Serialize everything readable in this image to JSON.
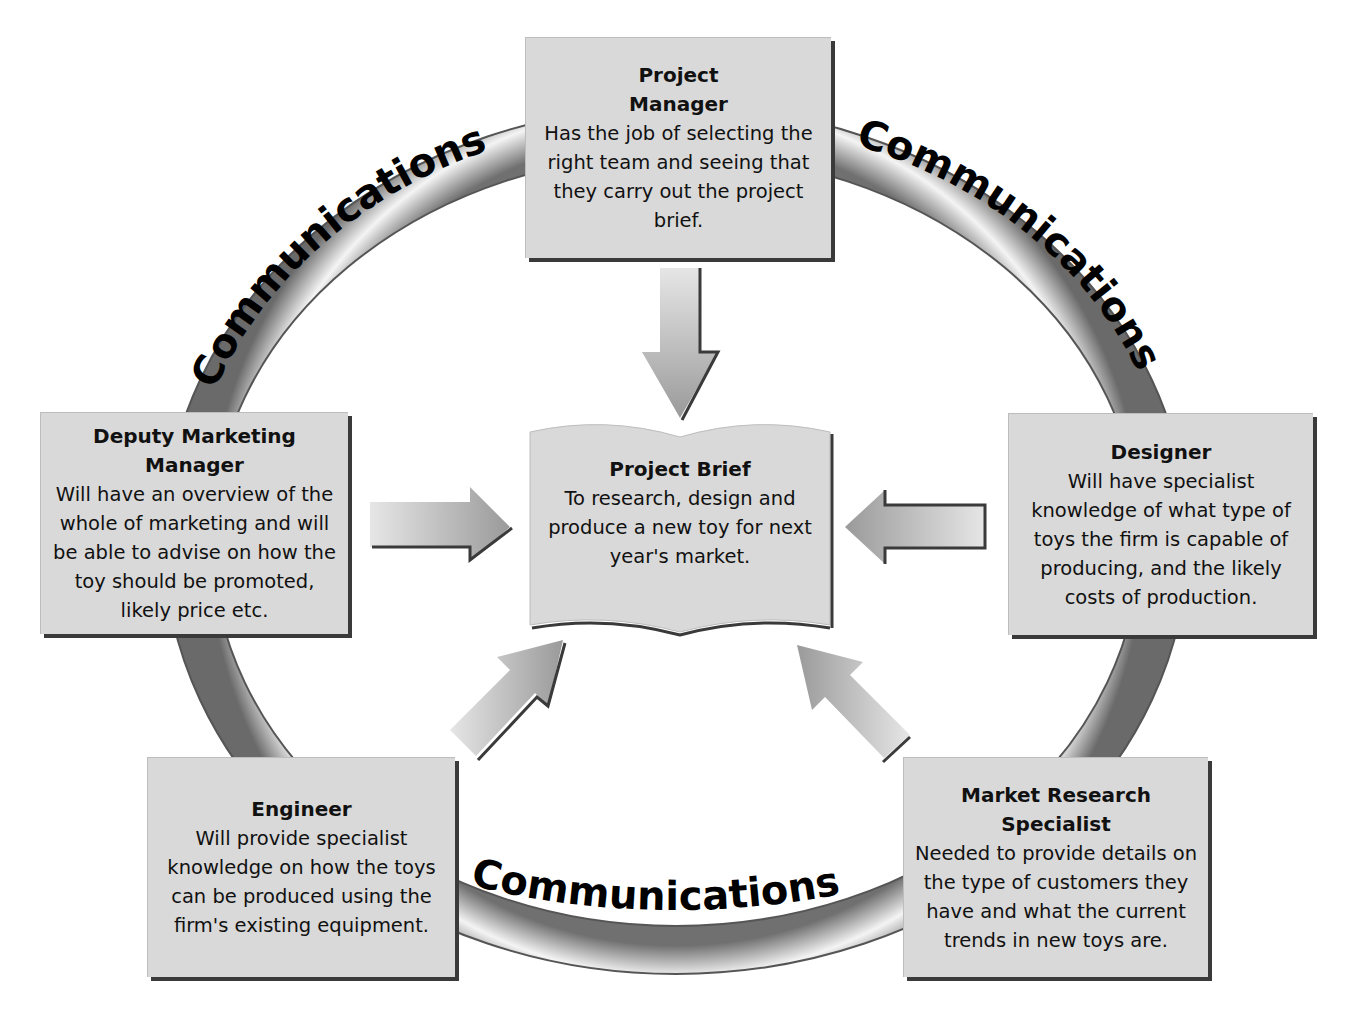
{
  "ring": {
    "label": "Communications",
    "segments": [
      "Communications",
      "Communications",
      "Communications"
    ]
  },
  "center": {
    "title": "Project Brief",
    "description": "To research, design and produce a new toy for next year's market."
  },
  "roles": [
    {
      "id": "project-manager",
      "title": "Project Manager",
      "description": "Has the job of selecting the right team and seeing that they carry out the project brief."
    },
    {
      "id": "deputy-marketing-manager",
      "title": "Deputy Marketing Manager",
      "description": "Will have an overview of the whole of marketing and will be able to advise on how the toy should be promoted, likely price etc."
    },
    {
      "id": "designer",
      "title": "Designer",
      "description": "Will have specialist knowledge of what type of toys the firm is capable of producing, and the likely costs of production."
    },
    {
      "id": "engineer",
      "title": "Engineer",
      "description": "Will provide specialist knowledge on how the toys can be produced using the firm's existing equipment."
    },
    {
      "id": "market-research-specialist",
      "title": "Market Research Specialist",
      "description": "Needed to provide details on the type of customers they have and what the current trends in new toys are."
    }
  ],
  "colors": {
    "box_fill": "#d9d9d9",
    "shadow": "#3a3a3a",
    "ring_light": "#f2f2f2",
    "ring_dark": "#6e6e6e",
    "text": "#111111"
  }
}
